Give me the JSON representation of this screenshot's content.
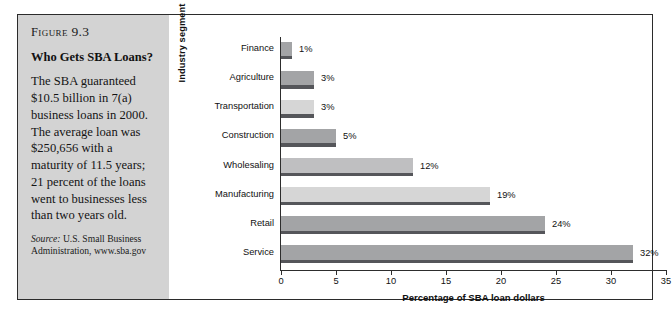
{
  "figure": {
    "number_label": "Figure",
    "number": "9.3",
    "title": "Who Gets SBA Loans?",
    "body": "The SBA guaranteed $10.5 billion in 7(a) business loans in 2000. The average loan was $250,656 with a maturity of 11.5 years; 21 percent of the loans went to businesses less than two years old.",
    "source_label": "Source:",
    "source_text": "U.S. Small Business Administration, www.sba.gov"
  },
  "colors": {
    "panel_background": "#d3d3d3",
    "frame_border": "#2b2b2b",
    "bar_light": "#d6d6d6",
    "bar_medium": "#a3a4a6",
    "bar_shadow": "#55565a",
    "axis": "#2d2d2d"
  },
  "chart_data": {
    "type": "bar",
    "orientation": "horizontal",
    "title": "",
    "xlabel": "Percentage of SBA loan dollars",
    "ylabel": "Industry segment",
    "xlim": [
      0,
      35
    ],
    "xticks": [
      0,
      5,
      10,
      15,
      20,
      25,
      30,
      35
    ],
    "xtick_labels": [
      "0",
      "5",
      "10",
      "15",
      "20",
      "25",
      "30",
      "35"
    ],
    "grid": false,
    "legend": null,
    "categories": [
      "Finance",
      "Agriculture",
      "Transportation",
      "Construction",
      "Wholesaling",
      "Manufacturing",
      "Retail",
      "Service"
    ],
    "values": [
      1,
      3,
      3,
      5,
      12,
      19,
      24,
      32
    ],
    "data_labels": [
      "1%",
      "3%",
      "3%",
      "5%",
      "12%",
      "19%",
      "24%",
      "32%"
    ],
    "bar_colors": [
      "#a3a4a6",
      "#a3a4a6",
      "#d6d6d6",
      "#a3a4a6",
      "#bfbfc1",
      "#d6d6d6",
      "#a3a4a6",
      "#a3a4a6"
    ]
  }
}
